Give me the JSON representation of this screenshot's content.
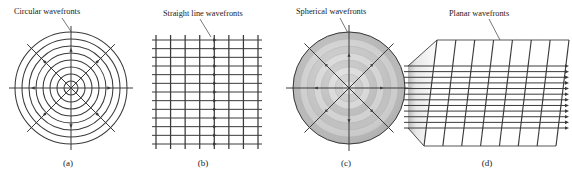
{
  "figure": {
    "background": "#ffffff",
    "ink": "#3a3a3a",
    "label_color": "#1a1a1a",
    "panels": [
      {
        "id": "a",
        "caption": "(a)",
        "callout": "Circular wavefronts",
        "type": "concentric-circles-2d",
        "wavefront_count": 8,
        "ray_count": 8,
        "ray_angles_deg": [
          0,
          45,
          90,
          135,
          180,
          225,
          270,
          315
        ],
        "center": [
          71,
          88
        ],
        "radii": [
          7,
          14,
          21,
          28,
          35,
          42,
          49,
          56
        ],
        "shaded": false
      },
      {
        "id": "b",
        "caption": "(b)",
        "callout": "Straight line wavefronts",
        "type": "straight-wavefront-grid",
        "wavefront_count": 8,
        "ray_count": 13,
        "arrow_column_index": 4,
        "shaded": false
      },
      {
        "id": "c",
        "caption": "(c)",
        "callout": "Spherical wavefronts",
        "type": "concentric-spheres-3d",
        "wavefront_count": 8,
        "ray_count": 8,
        "ray_angles_deg": [
          0,
          45,
          90,
          135,
          180,
          225,
          270,
          315
        ],
        "center": [
          349,
          88
        ],
        "outer_radius": 56,
        "shaded": true,
        "band_shades": [
          "#d8d8d8",
          "#c2c2c2",
          "#d2d2d2",
          "#b8b8b8",
          "#cfcfcf",
          "#bdbdbd",
          "#cacaca",
          "#b4b4b4"
        ]
      },
      {
        "id": "d",
        "caption": "(d)",
        "callout": "Planar wavefronts",
        "type": "planar-wavefronts-3d",
        "wavefront_count": 8,
        "ray_count": 12,
        "shaded": true,
        "plane_shades": [
          "#d9d9d9",
          "#e2e2e2",
          "#e8e8e8",
          "#ececec",
          "#efefef",
          "#f1f1f1",
          "#f3f3f3",
          "#f5f5f5"
        ]
      }
    ]
  }
}
